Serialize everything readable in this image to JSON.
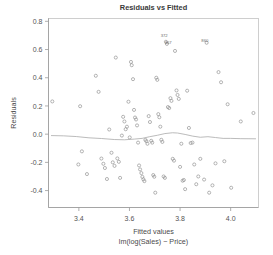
{
  "chart_data": {
    "type": "scatter",
    "title": "Residuals vs Fitted",
    "xlabel": "Fitted values",
    "xsublabel": "lm(log(Sales) ~ Price)",
    "ylabel": "Residuals",
    "xlim": [
      3.28,
      4.11
    ],
    "ylim": [
      -0.52,
      0.82
    ],
    "xticks": [
      3.4,
      3.6,
      3.8,
      4.0
    ],
    "xticklabels": [
      "3.4",
      "3.6",
      "3.8",
      "4.0"
    ],
    "yticks": [
      0.8,
      0.6,
      0.4,
      0.2,
      0.0,
      -0.2,
      -0.4
    ],
    "yticklabels": [
      "0.8",
      "0.6",
      "0.4",
      "0.2",
      "0.0",
      "-0.2",
      "-0.4"
    ],
    "grid": false,
    "legend": null,
    "marker": "open-circle",
    "point_color": "#8c8c8c",
    "smoother_color": "#a9a9a9",
    "text_color": "#4a4a4a",
    "points": [
      [
        3.295,
        0.232
      ],
      [
        3.405,
        0.198
      ],
      [
        3.412,
        -0.122
      ],
      [
        3.398,
        -0.215
      ],
      [
        3.432,
        -0.283
      ],
      [
        3.467,
        0.414
      ],
      [
        3.478,
        0.3
      ],
      [
        3.489,
        -0.173
      ],
      [
        3.497,
        -0.21
      ],
      [
        3.503,
        -0.24
      ],
      [
        3.511,
        -0.318
      ],
      [
        3.52,
        0.033
      ],
      [
        3.529,
        -0.132
      ],
      [
        3.534,
        -0.2
      ],
      [
        3.541,
        -0.225
      ],
      [
        3.546,
        0.543
      ],
      [
        3.552,
        -0.172
      ],
      [
        3.558,
        -0.196
      ],
      [
        3.563,
        -0.31
      ],
      [
        3.57,
        -0.01
      ],
      [
        3.575,
        0.123
      ],
      [
        3.58,
        0.09
      ],
      [
        3.585,
        0.035
      ],
      [
        3.59,
        0.053
      ],
      [
        3.596,
        0.23
      ],
      [
        3.601,
        -0.023
      ],
      [
        3.606,
        0.512
      ],
      [
        3.609,
        0.489
      ],
      [
        3.614,
        0.39
      ],
      [
        3.618,
        0.172
      ],
      [
        3.622,
        0.118
      ],
      [
        3.626,
        0.104
      ],
      [
        3.63,
        0.062
      ],
      [
        3.634,
        -0.06
      ],
      [
        3.638,
        -0.222
      ],
      [
        3.642,
        -0.25
      ],
      [
        3.647,
        -0.276
      ],
      [
        3.651,
        -0.303
      ],
      [
        3.655,
        -0.32
      ],
      [
        3.659,
        -0.333
      ],
      [
        3.663,
        -0.041
      ],
      [
        3.667,
        -0.05
      ],
      [
        3.671,
        -0.068
      ],
      [
        3.676,
        0.128
      ],
      [
        3.681,
        0.086
      ],
      [
        3.686,
        -0.047
      ],
      [
        3.69,
        -0.06
      ],
      [
        3.694,
        -0.29
      ],
      [
        3.698,
        -0.302
      ],
      [
        3.702,
        -0.415
      ],
      [
        3.706,
        0.4
      ],
      [
        3.71,
        0.385
      ],
      [
        3.714,
        0.142
      ],
      [
        3.718,
        0.12
      ],
      [
        3.722,
        0.053
      ],
      [
        3.726,
        -0.04
      ],
      [
        3.73,
        -0.055
      ],
      [
        3.735,
        -0.3
      ],
      [
        3.74,
        -0.31
      ],
      [
        3.744,
        0.655
      ],
      [
        3.748,
        0.64
      ],
      [
        3.752,
        0.192
      ],
      [
        3.757,
        0.185
      ],
      [
        3.762,
        0.255
      ],
      [
        3.766,
        0.236
      ],
      [
        3.771,
        -0.175
      ],
      [
        3.776,
        -0.188
      ],
      [
        3.78,
        0.59
      ],
      [
        3.786,
        0.31
      ],
      [
        3.79,
        0.278
      ],
      [
        3.795,
        0.25
      ],
      [
        3.8,
        -0.232
      ],
      [
        3.805,
        -0.068
      ],
      [
        3.81,
        -0.33
      ],
      [
        3.815,
        -0.325
      ],
      [
        3.82,
        -0.39
      ],
      [
        3.828,
        0.308
      ],
      [
        3.835,
        0.044
      ],
      [
        3.842,
        -0.063
      ],
      [
        3.849,
        -0.06
      ],
      [
        3.856,
        -0.215
      ],
      [
        3.864,
        -0.355
      ],
      [
        3.872,
        -0.3
      ],
      [
        3.88,
        -0.175
      ],
      [
        3.895,
        -0.322
      ],
      [
        3.905,
        0.648
      ],
      [
        3.915,
        -0.415
      ],
      [
        3.928,
        -0.363
      ],
      [
        3.94,
        -0.207
      ],
      [
        3.952,
        0.44
      ],
      [
        3.962,
        0.368
      ],
      [
        3.975,
        -0.192
      ],
      [
        3.988,
        0.212
      ],
      [
        4.002,
        -0.38
      ],
      [
        4.04,
        0.09
      ],
      [
        4.09,
        0.15
      ]
    ],
    "smoother": [
      [
        3.29,
        -0.01
      ],
      [
        3.34,
        -0.012
      ],
      [
        3.39,
        -0.017
      ],
      [
        3.44,
        -0.026
      ],
      [
        3.49,
        -0.031
      ],
      [
        3.54,
        -0.038
      ],
      [
        3.58,
        -0.04
      ],
      [
        3.62,
        -0.035
      ],
      [
        3.65,
        -0.03
      ],
      [
        3.68,
        -0.018
      ],
      [
        3.71,
        -0.008
      ],
      [
        3.74,
        0.004
      ],
      [
        3.77,
        0.01
      ],
      [
        3.79,
        0.008
      ],
      [
        3.82,
        -0.002
      ],
      [
        3.85,
        -0.014
      ],
      [
        3.88,
        -0.022
      ],
      [
        3.91,
        -0.018
      ],
      [
        3.94,
        -0.024
      ],
      [
        3.97,
        -0.03
      ],
      [
        4.0,
        -0.03
      ],
      [
        4.04,
        -0.032
      ],
      [
        4.1,
        -0.033
      ]
    ],
    "outlier_labels": [
      {
        "text": "372",
        "x": 3.737,
        "y": 0.69
      },
      {
        "text": "367",
        "x": 3.753,
        "y": 0.64
      },
      {
        "text": "860",
        "x": 3.898,
        "y": 0.65
      }
    ]
  }
}
